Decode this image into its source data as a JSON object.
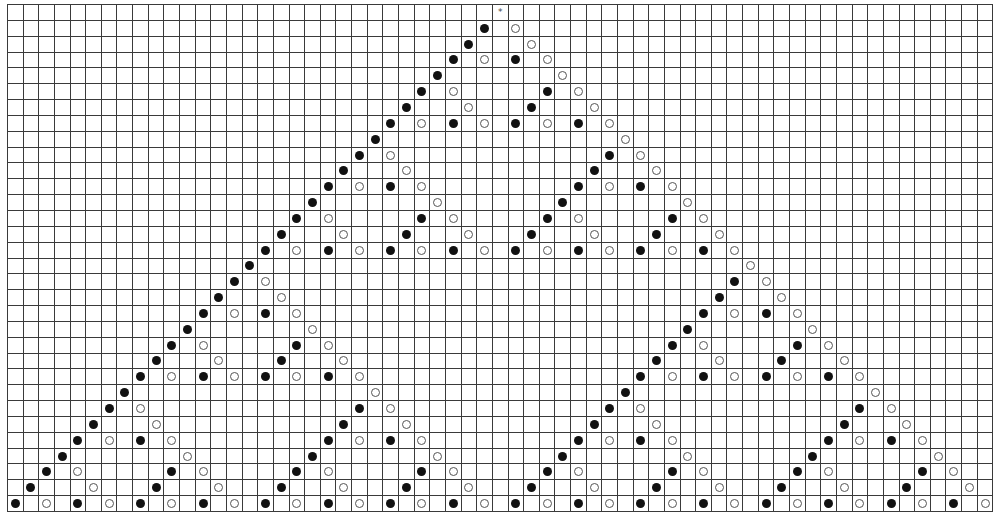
{
  "grid": {
    "columns": 63,
    "rows": 32,
    "apex_column": 31,
    "legend": {
      "F": "filled-circle",
      "H": "hollow-circle",
      "*": "star"
    },
    "colors": {
      "line": "#3a3a3a",
      "filled": "#111111",
      "hollow_stroke": "#555555"
    },
    "star": {
      "row": 0,
      "col": 31,
      "glyph": "*"
    },
    "markers": [
      [
        [
          30,
          "F"
        ],
        [
          32,
          "H"
        ]
      ],
      [
        [
          29,
          "F"
        ],
        [
          33,
          "H"
        ]
      ],
      [
        [
          28,
          "F"
        ],
        [
          30,
          "H"
        ],
        [
          32,
          "F"
        ],
        [
          34,
          "H"
        ]
      ],
      [
        [
          27,
          "F"
        ],
        [
          35,
          "H"
        ]
      ],
      [
        [
          26,
          "F"
        ],
        [
          28,
          "H"
        ],
        [
          34,
          "F"
        ],
        [
          36,
          "H"
        ]
      ],
      [
        [
          25,
          "F"
        ],
        [
          29,
          "H"
        ],
        [
          33,
          "F"
        ],
        [
          37,
          "H"
        ]
      ],
      [
        [
          24,
          "F"
        ],
        [
          26,
          "H"
        ],
        [
          28,
          "F"
        ],
        [
          30,
          "H"
        ],
        [
          32,
          "F"
        ],
        [
          34,
          "H"
        ],
        [
          36,
          "F"
        ],
        [
          38,
          "H"
        ]
      ],
      [
        [
          23,
          "F"
        ],
        [
          39,
          "H"
        ]
      ],
      [
        [
          22,
          "F"
        ],
        [
          24,
          "H"
        ],
        [
          38,
          "F"
        ],
        [
          40,
          "H"
        ]
      ],
      [
        [
          21,
          "F"
        ],
        [
          25,
          "H"
        ],
        [
          37,
          "F"
        ],
        [
          41,
          "H"
        ]
      ],
      [
        [
          20,
          "F"
        ],
        [
          22,
          "H"
        ],
        [
          24,
          "F"
        ],
        [
          26,
          "H"
        ],
        [
          36,
          "F"
        ],
        [
          38,
          "H"
        ],
        [
          40,
          "F"
        ],
        [
          42,
          "H"
        ]
      ],
      [
        [
          19,
          "F"
        ],
        [
          27,
          "H"
        ],
        [
          35,
          "F"
        ],
        [
          43,
          "H"
        ]
      ],
      [
        [
          18,
          "F"
        ],
        [
          20,
          "H"
        ],
        [
          26,
          "F"
        ],
        [
          28,
          "H"
        ],
        [
          34,
          "F"
        ],
        [
          36,
          "H"
        ],
        [
          42,
          "F"
        ],
        [
          44,
          "H"
        ]
      ],
      [
        [
          17,
          "F"
        ],
        [
          21,
          "H"
        ],
        [
          25,
          "F"
        ],
        [
          29,
          "H"
        ],
        [
          33,
          "F"
        ],
        [
          37,
          "H"
        ],
        [
          41,
          "F"
        ],
        [
          45,
          "H"
        ]
      ],
      [
        [
          16,
          "F"
        ],
        [
          18,
          "H"
        ],
        [
          20,
          "F"
        ],
        [
          22,
          "H"
        ],
        [
          24,
          "F"
        ],
        [
          26,
          "H"
        ],
        [
          28,
          "F"
        ],
        [
          30,
          "H"
        ],
        [
          32,
          "F"
        ],
        [
          34,
          "H"
        ],
        [
          36,
          "F"
        ],
        [
          38,
          "H"
        ],
        [
          40,
          "F"
        ],
        [
          42,
          "H"
        ],
        [
          44,
          "F"
        ],
        [
          46,
          "H"
        ]
      ],
      [
        [
          15,
          "F"
        ],
        [
          47,
          "H"
        ]
      ],
      [
        [
          14,
          "F"
        ],
        [
          16,
          "H"
        ],
        [
          46,
          "F"
        ],
        [
          48,
          "H"
        ]
      ],
      [
        [
          13,
          "F"
        ],
        [
          17,
          "H"
        ],
        [
          45,
          "F"
        ],
        [
          49,
          "H"
        ]
      ],
      [
        [
          12,
          "F"
        ],
        [
          14,
          "H"
        ],
        [
          16,
          "F"
        ],
        [
          18,
          "H"
        ],
        [
          44,
          "F"
        ],
        [
          46,
          "H"
        ],
        [
          48,
          "F"
        ],
        [
          50,
          "H"
        ]
      ],
      [
        [
          11,
          "F"
        ],
        [
          19,
          "H"
        ],
        [
          43,
          "F"
        ],
        [
          51,
          "H"
        ]
      ],
      [
        [
          10,
          "F"
        ],
        [
          12,
          "H"
        ],
        [
          18,
          "F"
        ],
        [
          20,
          "H"
        ],
        [
          42,
          "F"
        ],
        [
          44,
          "H"
        ],
        [
          50,
          "F"
        ],
        [
          52,
          "H"
        ]
      ],
      [
        [
          9,
          "F"
        ],
        [
          13,
          "H"
        ],
        [
          17,
          "F"
        ],
        [
          21,
          "H"
        ],
        [
          41,
          "F"
        ],
        [
          45,
          "H"
        ],
        [
          49,
          "F"
        ],
        [
          53,
          "H"
        ]
      ],
      [
        [
          8,
          "F"
        ],
        [
          10,
          "H"
        ],
        [
          12,
          "F"
        ],
        [
          14,
          "H"
        ],
        [
          16,
          "F"
        ],
        [
          18,
          "H"
        ],
        [
          20,
          "F"
        ],
        [
          22,
          "H"
        ],
        [
          40,
          "F"
        ],
        [
          42,
          "H"
        ],
        [
          44,
          "F"
        ],
        [
          46,
          "H"
        ],
        [
          48,
          "F"
        ],
        [
          50,
          "H"
        ],
        [
          52,
          "F"
        ],
        [
          54,
          "H"
        ]
      ],
      [
        [
          7,
          "F"
        ],
        [
          23,
          "H"
        ],
        [
          39,
          "F"
        ],
        [
          55,
          "H"
        ]
      ],
      [
        [
          6,
          "F"
        ],
        [
          8,
          "H"
        ],
        [
          22,
          "F"
        ],
        [
          24,
          "H"
        ],
        [
          38,
          "F"
        ],
        [
          40,
          "H"
        ],
        [
          54,
          "F"
        ],
        [
          56,
          "H"
        ]
      ],
      [
        [
          5,
          "F"
        ],
        [
          9,
          "H"
        ],
        [
          21,
          "F"
        ],
        [
          25,
          "H"
        ],
        [
          37,
          "F"
        ],
        [
          41,
          "H"
        ],
        [
          53,
          "F"
        ],
        [
          57,
          "H"
        ]
      ],
      [
        [
          4,
          "F"
        ],
        [
          6,
          "H"
        ],
        [
          8,
          "F"
        ],
        [
          10,
          "H"
        ],
        [
          20,
          "F"
        ],
        [
          22,
          "H"
        ],
        [
          24,
          "F"
        ],
        [
          26,
          "H"
        ],
        [
          36,
          "F"
        ],
        [
          38,
          "H"
        ],
        [
          40,
          "F"
        ],
        [
          42,
          "H"
        ],
        [
          52,
          "F"
        ],
        [
          54,
          "H"
        ],
        [
          56,
          "F"
        ],
        [
          58,
          "H"
        ]
      ],
      [
        [
          3,
          "F"
        ],
        [
          11,
          "H"
        ],
        [
          19,
          "F"
        ],
        [
          27,
          "H"
        ],
        [
          35,
          "F"
        ],
        [
          43,
          "H"
        ],
        [
          51,
          "F"
        ],
        [
          59,
          "H"
        ]
      ],
      [
        [
          2,
          "F"
        ],
        [
          4,
          "H"
        ],
        [
          10,
          "F"
        ],
        [
          12,
          "H"
        ],
        [
          18,
          "F"
        ],
        [
          20,
          "H"
        ],
        [
          26,
          "F"
        ],
        [
          28,
          "H"
        ],
        [
          34,
          "F"
        ],
        [
          36,
          "H"
        ],
        [
          42,
          "F"
        ],
        [
          44,
          "H"
        ],
        [
          50,
          "F"
        ],
        [
          52,
          "H"
        ],
        [
          58,
          "F"
        ],
        [
          60,
          "H"
        ]
      ],
      [
        [
          1,
          "F"
        ],
        [
          5,
          "H"
        ],
        [
          9,
          "F"
        ],
        [
          13,
          "H"
        ],
        [
          17,
          "F"
        ],
        [
          21,
          "H"
        ],
        [
          25,
          "F"
        ],
        [
          29,
          "H"
        ],
        [
          33,
          "F"
        ],
        [
          37,
          "H"
        ],
        [
          41,
          "F"
        ],
        [
          45,
          "H"
        ],
        [
          49,
          "F"
        ],
        [
          53,
          "H"
        ],
        [
          57,
          "F"
        ],
        [
          61,
          "H"
        ]
      ],
      [
        [
          0,
          "F"
        ],
        [
          2,
          "H"
        ],
        [
          4,
          "F"
        ],
        [
          6,
          "H"
        ],
        [
          8,
          "F"
        ],
        [
          10,
          "H"
        ],
        [
          12,
          "F"
        ],
        [
          14,
          "H"
        ],
        [
          16,
          "F"
        ],
        [
          18,
          "H"
        ],
        [
          20,
          "F"
        ],
        [
          22,
          "H"
        ],
        [
          24,
          "F"
        ],
        [
          26,
          "H"
        ],
        [
          28,
          "F"
        ],
        [
          30,
          "H"
        ],
        [
          32,
          "F"
        ],
        [
          34,
          "H"
        ],
        [
          36,
          "F"
        ],
        [
          38,
          "H"
        ],
        [
          40,
          "F"
        ],
        [
          42,
          "H"
        ],
        [
          44,
          "F"
        ],
        [
          46,
          "H"
        ],
        [
          48,
          "F"
        ],
        [
          50,
          "H"
        ],
        [
          52,
          "F"
        ],
        [
          54,
          "H"
        ],
        [
          56,
          "F"
        ],
        [
          58,
          "H"
        ],
        [
          60,
          "F"
        ],
        [
          62,
          "H"
        ]
      ]
    ]
  }
}
